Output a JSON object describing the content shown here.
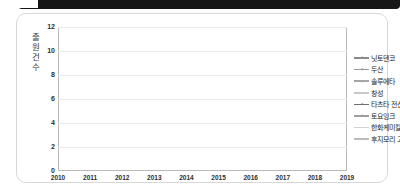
{
  "card": {
    "title": ""
  },
  "chart_data": {
    "type": "line",
    "title": "",
    "subtitle": "",
    "xlabel": "",
    "ylabel": "출원건수",
    "categories": [
      "2010",
      "2011",
      "2012",
      "2013",
      "2014",
      "2015",
      "2016",
      "2017",
      "2018",
      "2019"
    ],
    "x": [
      2010,
      2011,
      2012,
      2013,
      2014,
      2015,
      2016,
      2017,
      2018,
      2019
    ],
    "ylim": [
      0,
      12
    ],
    "yticks": [
      0,
      2,
      4,
      6,
      8,
      10,
      12
    ],
    "xlim": [
      2010,
      2019
    ],
    "grid": true,
    "legend_position": "right",
    "series": [
      {
        "name": "닛토덴코",
        "color": "#8a8a8a",
        "marker": "diamond",
        "values": [
          0,
          0,
          0,
          1,
          1,
          2,
          1,
          3,
          7,
          2
        ]
      },
      {
        "name": "두산",
        "color": "#9a9a9a",
        "marker": "square",
        "values": [
          0,
          0,
          0,
          0,
          0,
          0,
          0,
          0,
          0,
          0
        ]
      },
      {
        "name": "솔루에타",
        "color": "#a6a6a6",
        "marker": "triangle",
        "values": [
          0,
          0,
          0,
          0,
          1,
          1,
          1,
          2,
          5,
          0
        ]
      },
      {
        "name": "창성",
        "color": "#c9c9c9",
        "marker": "none",
        "values": [
          0,
          0,
          1,
          2,
          1,
          2,
          2,
          1,
          1,
          2
        ]
      },
      {
        "name": "타츠타 전선",
        "color": "#6f6f6f",
        "marker": "circle",
        "values": [
          0,
          0,
          1,
          0,
          2,
          3,
          10,
          2,
          11,
          0
        ]
      },
      {
        "name": "토요잉크",
        "color": "#9e9e9e",
        "marker": "cross",
        "values": [
          1,
          1,
          1,
          1,
          1,
          1,
          2,
          2,
          2,
          2
        ]
      },
      {
        "name": "한화케미칼",
        "color": "#d2d2d2",
        "marker": "none",
        "values": [
          0,
          0,
          3,
          1,
          1,
          2,
          2,
          1,
          0,
          0
        ]
      },
      {
        "name": "후지모리 고교",
        "color": "#bcbcbc",
        "marker": "none",
        "values": [
          0,
          1,
          0,
          1,
          2,
          2,
          1,
          1,
          1,
          3
        ]
      }
    ]
  }
}
